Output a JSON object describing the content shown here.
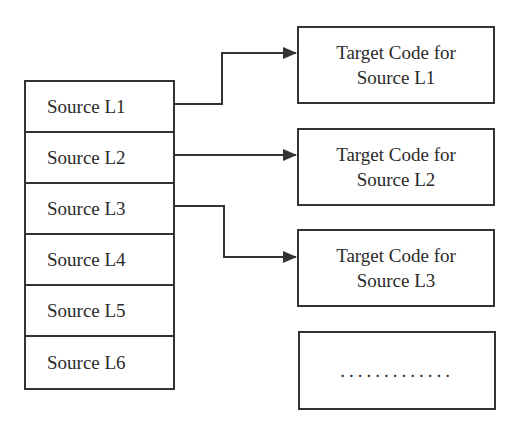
{
  "diagram": {
    "source_column": {
      "items": [
        {
          "label": "Source L1"
        },
        {
          "label": "Source L2"
        },
        {
          "label": "Source L3"
        },
        {
          "label": "Source L4"
        },
        {
          "label": "Source L5"
        },
        {
          "label": "Source L6"
        }
      ]
    },
    "targets": [
      {
        "line1": "Target Code for",
        "line2": "Source L1"
      },
      {
        "line1": "Target Code for",
        "line2": "Source L2"
      },
      {
        "line1": "Target Code for",
        "line2": "Source L3"
      },
      {
        "line1": "",
        "line2": "............."
      }
    ],
    "connections": [
      {
        "from": "Source L1",
        "to": "Target Code for Source L1"
      },
      {
        "from": "Source L2",
        "to": "Target Code for Source L2"
      },
      {
        "from": "Source L3",
        "to": "Target Code for Source L3"
      }
    ],
    "colors": {
      "stroke": "#333333",
      "text": "#2a2a2a",
      "background": "#ffffff"
    }
  }
}
